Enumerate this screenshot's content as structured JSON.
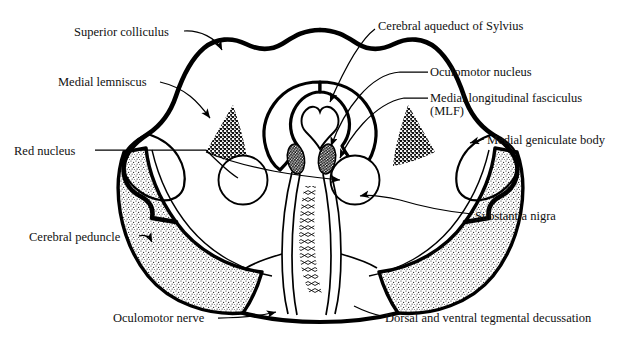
{
  "figure": {
    "type": "anatomical-line-diagram",
    "background_color": "#ffffff",
    "ink_color": "#000000",
    "width": 641,
    "height": 346
  },
  "labels": [
    {
      "id": "superior-colliculus",
      "text": "Superior colliculus",
      "x": 74,
      "y": 26,
      "align": "left",
      "leader": "curved-arrow-right-down"
    },
    {
      "id": "cerebral-aqueduct",
      "text": "Cerebral aqueduct of Sylvius",
      "x": 378,
      "y": 20,
      "align": "left",
      "leader": "curved-arrow-down-left"
    },
    {
      "id": "medial-lemniscus",
      "text": "Medial lemniscus",
      "x": 58,
      "y": 76,
      "align": "left",
      "leader": "line-arrow-right-down"
    },
    {
      "id": "oculomotor-nucleus",
      "text": "Oculomotor nucleus",
      "x": 430,
      "y": 66,
      "align": "left",
      "leader": "line-left-curve-to-nucleus"
    },
    {
      "id": "mlf",
      "text": "Medial longitudinal fasciculus",
      "x": 430,
      "y": 92,
      "align": "left",
      "leader": "line-left-curve-to-mlf"
    },
    {
      "id": "mlf-abbrev",
      "text": "(MLF)",
      "x": 430,
      "y": 105,
      "align": "left",
      "leader": "none"
    },
    {
      "id": "medial-geniculate-body",
      "text": "Medial geniculate body",
      "x": 487,
      "y": 134,
      "align": "left",
      "leader": "short-arrow-left"
    },
    {
      "id": "red-nucleus",
      "text": "Red nucleus",
      "x": 14,
      "y": 145,
      "align": "left",
      "leader": "long-line-right-branching"
    },
    {
      "id": "substantia-nigra",
      "text": "Substantia nigra",
      "x": 475,
      "y": 210,
      "align": "left",
      "leader": "line-left-to-arrow"
    },
    {
      "id": "cerebral-peduncle",
      "text": "Cerebral peduncle",
      "x": 29,
      "y": 231,
      "align": "left",
      "leader": "short-hook-arrow-right"
    },
    {
      "id": "oculomotor-nerve",
      "text": "Oculomotor nerve",
      "x": 113,
      "y": 312,
      "align": "left",
      "leader": "line-right-arrow"
    },
    {
      "id": "dorsal-ventral-tegmental-decussation",
      "text": "Dorsal and ventral tegmental decussation",
      "x": 385,
      "y": 312,
      "align": "left",
      "leader": "line-left"
    }
  ],
  "structures": [
    {
      "id": "midbrain-outline",
      "name": "midbrain cross-section outline",
      "stroke_weight": "thick"
    },
    {
      "id": "periaqueductal-gray-outline",
      "name": "periaqueductal gray boundary",
      "stroke_weight": "medium"
    },
    {
      "id": "cerebral-aqueduct-lumen",
      "name": "cerebral aqueduct (heart-shaped lumen)",
      "stroke_weight": "thin"
    },
    {
      "id": "oculomotor-nucleus-left",
      "name": "oculomotor nucleus (left)",
      "fill": "dark-stipple"
    },
    {
      "id": "oculomotor-nucleus-right",
      "name": "oculomotor nucleus (right)",
      "fill": "dark-stipple"
    },
    {
      "id": "medial-lemniscus-left",
      "name": "medial lemniscus (left)",
      "fill": "coarse-stipple-triangle"
    },
    {
      "id": "medial-lemniscus-right",
      "name": "medial lemniscus (right)",
      "fill": "coarse-stipple-triangle"
    },
    {
      "id": "red-nucleus-left",
      "name": "red nucleus (left)",
      "shape": "circle-outline"
    },
    {
      "id": "red-nucleus-right",
      "name": "red nucleus (right)",
      "shape": "circle-outline"
    },
    {
      "id": "cerebral-peduncle-left",
      "name": "cerebral peduncle (left)",
      "fill": "fine-stipple"
    },
    {
      "id": "cerebral-peduncle-right",
      "name": "cerebral peduncle (right)",
      "fill": "fine-stipple"
    },
    {
      "id": "substantia-nigra-left",
      "name": "substantia nigra band (left)",
      "stroke_weight": "thin"
    },
    {
      "id": "substantia-nigra-right",
      "name": "substantia nigra band (right)",
      "stroke_weight": "thin"
    },
    {
      "id": "medial-geniculate-left",
      "name": "medial geniculate body (left)",
      "stroke_weight": "medium"
    },
    {
      "id": "medial-geniculate-right",
      "name": "medial geniculate body (right)",
      "stroke_weight": "medium"
    },
    {
      "id": "tegmental-decussation",
      "name": "dorsal and ventral tegmental decussation",
      "fill": "crossing-hatch-fibers"
    },
    {
      "id": "oculomotor-nerve-fibers",
      "name": "oculomotor nerve fibers",
      "stroke_weight": "thin"
    }
  ]
}
